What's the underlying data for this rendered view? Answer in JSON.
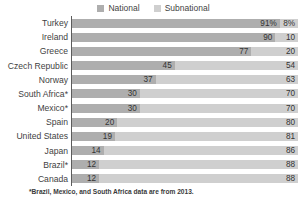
{
  "chart_data": {
    "type": "bar",
    "subtype": "stacked-horizontal-100pct",
    "title": "",
    "xlabel": "",
    "ylabel": "",
    "xlim": [
      0,
      100
    ],
    "grid": false,
    "legend_position": "top-center",
    "categories": [
      "Turkey",
      "Ireland",
      "Greece",
      "Czech Republic",
      "Norway",
      "South Africa*",
      "Mexico*",
      "Spain",
      "United States",
      "Japan",
      "Brazil*",
      "Canada"
    ],
    "series": [
      {
        "name": "National",
        "color": "#aeaeae",
        "values": [
          91,
          90,
          77,
          45,
          37,
          30,
          30,
          20,
          19,
          14,
          12,
          12
        ],
        "labels": [
          "91%",
          "90",
          "77",
          "45",
          "37",
          "30",
          "30",
          "20",
          "19",
          "14",
          "12",
          "12"
        ]
      },
      {
        "name": "Subnational",
        "color": "#cfcfcf",
        "values": [
          8,
          10,
          20,
          54,
          63,
          70,
          70,
          80,
          81,
          86,
          88,
          88
        ],
        "labels": [
          "8%",
          "10",
          "20",
          "54",
          "63",
          "70",
          "70",
          "80",
          "81",
          "86",
          "88",
          "88"
        ]
      }
    ],
    "annotations": [
      "*Brazil, Mexico, and South Africa data are from 2013."
    ]
  },
  "legend": {
    "entries": [
      {
        "label": "National",
        "color": "#aeaeae"
      },
      {
        "label": "Subnational",
        "color": "#cfcfcf"
      }
    ]
  },
  "footnote": "*Brazil, Mexico, and South Africa data are from 2013."
}
